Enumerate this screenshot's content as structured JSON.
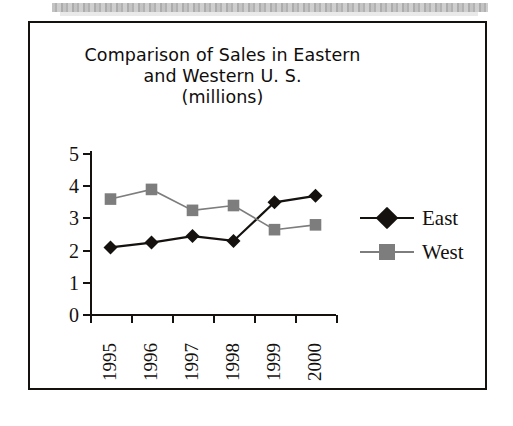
{
  "figure": {
    "title_lines": [
      "Comparison of Sales in Eastern",
      "and Western U. S.",
      "(millions)"
    ],
    "title_full": "Comparison of Sales in Eastern and Western U. S. (millions)"
  },
  "colors": {
    "east": "#15110f",
    "west": "#7d7d7d",
    "axis": "#15110f",
    "background": "#ffffff",
    "frame": "#15110f"
  },
  "legend": {
    "position": "right",
    "items": [
      {
        "label": "East",
        "marker": "diamond",
        "color": "#15110f"
      },
      {
        "label": "West",
        "marker": "square",
        "color": "#7d7d7d"
      }
    ]
  },
  "axes": {
    "y_ticks": [
      "0",
      "1",
      "2",
      "3",
      "4",
      "5"
    ],
    "x_ticks": [
      "1995",
      "1996",
      "1997",
      "1998",
      "1999",
      "2000"
    ]
  },
  "chart_data": {
    "type": "line",
    "title": "Comparison of Sales in Eastern and Western U. S. (millions)",
    "xlabel": "",
    "ylabel": "",
    "categories": [
      "1995",
      "1996",
      "1997",
      "1998",
      "1999",
      "2000"
    ],
    "series": [
      {
        "name": "East",
        "values": [
          2.1,
          2.25,
          2.45,
          2.3,
          3.5,
          3.7
        ],
        "color": "#15110f",
        "marker": "diamond"
      },
      {
        "name": "West",
        "values": [
          3.6,
          3.9,
          3.25,
          3.4,
          2.65,
          2.8
        ],
        "color": "#7d7d7d",
        "marker": "square"
      }
    ],
    "ylim": [
      0,
      5
    ],
    "ytick_step": 1,
    "grid": false,
    "legend_position": "right",
    "units": "millions"
  }
}
